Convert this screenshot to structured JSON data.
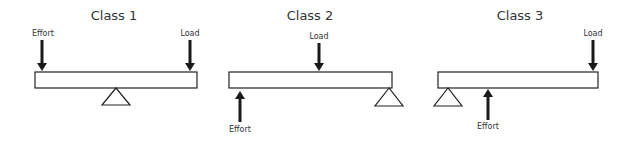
{
  "diagram": {
    "panels": [
      {
        "title": "Class 1",
        "effort_label": "Effort",
        "load_label": "Load",
        "effort_direction": "down",
        "effort_position": "left end, above beam",
        "load_position": "right end, above beam",
        "fulcrum_position": "middle, below beam"
      },
      {
        "title": "Class 2",
        "effort_label": "Effort",
        "load_label": "Load",
        "effort_direction": "up",
        "effort_position": "left end, below beam",
        "load_position": "middle, above beam",
        "fulcrum_position": "right end, below beam"
      },
      {
        "title": "Class 3",
        "effort_label": "Effort",
        "load_label": "Load",
        "effort_direction": "up",
        "effort_position": "near left, below beam",
        "load_position": "right end, above beam",
        "fulcrum_position": "left end, below beam"
      }
    ],
    "colors": {
      "stroke": "#222222",
      "arrow": "#1a1a1a",
      "text": "#333333",
      "background": "#ffffff"
    }
  }
}
